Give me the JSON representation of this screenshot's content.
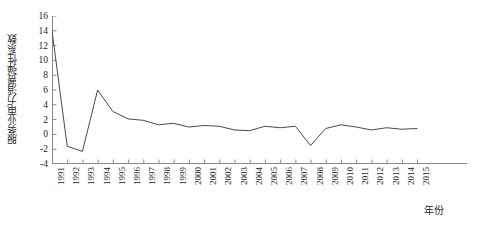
{
  "chart_data": {
    "type": "line",
    "title": "",
    "xlabel": "年份",
    "ylabel": "服务业电力消费弹性系数",
    "grid": false,
    "legend": null,
    "xlim": [
      1991,
      2015
    ],
    "ylim": [
      -4,
      16
    ],
    "ytick_values": [
      16,
      14,
      12,
      10,
      8,
      6,
      4,
      2,
      0,
      -2,
      -4
    ],
    "ytick_labels": [
      "16",
      "14",
      "12",
      "10",
      "8",
      "6",
      "4",
      "2",
      "0",
      "-2",
      "-4"
    ],
    "x": [
      1991,
      1992,
      1993,
      1994,
      1995,
      1996,
      1997,
      1998,
      1999,
      2000,
      2001,
      2002,
      2003,
      2004,
      2005,
      2006,
      2007,
      2008,
      2009,
      2010,
      2011,
      2012,
      2013,
      2014,
      2015
    ],
    "xtick_labels": [
      "1991",
      "1992",
      "1993",
      "1994",
      "1995",
      "1996",
      "1997",
      "1998",
      "1999",
      "2000",
      "2001",
      "2002",
      "2003",
      "2004",
      "2005",
      "2006",
      "2007",
      "2008",
      "2009",
      "2010",
      "2011",
      "2012",
      "2013",
      "2014",
      "2015"
    ],
    "values": [
      14.0,
      -1.6,
      -2.3,
      6.0,
      3.1,
      2.1,
      1.9,
      1.3,
      1.5,
      1.0,
      1.2,
      1.1,
      0.6,
      0.5,
      1.1,
      0.9,
      1.1,
      -1.5,
      0.8,
      1.3,
      1.0,
      0.6,
      0.9,
      0.7,
      0.8
    ],
    "series_name": "服务业电力消费弹性系数",
    "line_color": "#4a4a4a",
    "line_width": 1.0,
    "axis_color": "#8a8a8a",
    "background": "#ffffff"
  }
}
